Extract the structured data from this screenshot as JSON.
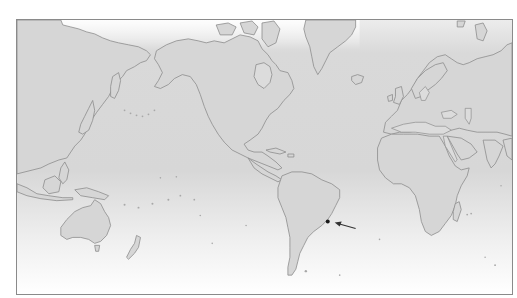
{
  "map": {
    "type": "world-map",
    "projection": "mercator-pacific-centered",
    "colors": {
      "ocean_top": "#d9d9d9",
      "ocean_bottom": "#ffffff",
      "land": "#d6d6d6",
      "coastline": "#8c8c8c",
      "frame": "#8a8a8a",
      "marker": "#1a1a1a",
      "arrow": "#333333"
    },
    "regions": [
      "Asia",
      "North America",
      "Europe",
      "Africa",
      "South America",
      "Australia",
      "Greenland",
      "New Zealand",
      "Madagascar",
      "Japan"
    ],
    "marker": {
      "label": "",
      "location": "Southeast coast of Brazil",
      "x": 328,
      "y": 222
    },
    "arrow": {
      "from": [
        356,
        229
      ],
      "to": [
        336,
        224
      ],
      "direction": "pointing-left-at-marker"
    }
  }
}
